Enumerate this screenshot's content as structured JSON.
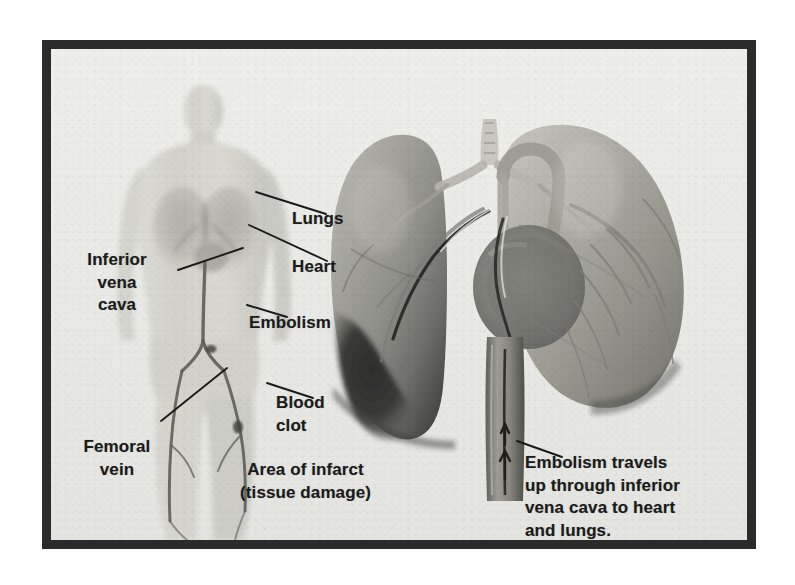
{
  "figure": {
    "kind": "medical-illustration",
    "frame_color": "#2b2b2b",
    "paper_color": "#e9e9e6",
    "ink_color": "#1b1b1b"
  },
  "labels": [
    {
      "id": "lungs",
      "text": "Lungs",
      "x": 283,
      "y": 199,
      "align": "left"
    },
    {
      "id": "heart",
      "text": "Heart",
      "x": 283,
      "y": 247,
      "align": "left"
    },
    {
      "id": "inferior-vena-cava",
      "text": "Inferior\nvena\ncava",
      "x": 62,
      "y": 240,
      "align": "center"
    },
    {
      "id": "embolism",
      "text": "Embolism",
      "x": 240,
      "y": 303,
      "align": "left"
    },
    {
      "id": "blood-clot",
      "text": "Blood\nclot",
      "x": 267,
      "y": 383,
      "align": "left"
    },
    {
      "id": "femoral-vein",
      "text": "Femoral\nvein",
      "x": 62,
      "y": 427,
      "align": "center"
    },
    {
      "id": "area-of-infarct",
      "text": "Area of infarct\n(tissue damage)",
      "x": 272,
      "y": 450,
      "align": "center"
    },
    {
      "id": "embolism-travels",
      "text": "Embolism travels\nup through inferior\nvena cava to heart\nand lungs.",
      "x": 516,
      "y": 443,
      "align": "left"
    }
  ],
  "anatomy": {
    "body_figure": {
      "name": "anterior full-body silhouette",
      "shows": [
        "torso",
        "lungs",
        "inferior vena cava",
        "femoral vein",
        "embolism",
        "blood clot"
      ]
    },
    "lung_figure": {
      "name": "anterior view of lungs, heart and great vessels",
      "shows": [
        "left lung",
        "right lung",
        "trachea",
        "bronchi",
        "aortic arch",
        "heart",
        "pulmonary arteries",
        "inferior vena cava",
        "area of infarct"
      ]
    },
    "infarct_color": "#3a3a3a",
    "lung_color": "#9a9a94",
    "vessel_color": "#5a5a58"
  },
  "leaders": {
    "lungs": {
      "from": [
        275,
        205
      ],
      "to": [
        205,
        182
      ]
    },
    "heart": {
      "from": [
        276,
        252
      ],
      "to": [
        198,
        216
      ]
    },
    "ivc": {
      "from": [
        127,
        261
      ],
      "to": [
        192,
        239
      ]
    },
    "embolism": {
      "from": [
        236,
        308
      ],
      "to": [
        196,
        296
      ]
    },
    "blood_clot": {
      "from": [
        262,
        389
      ],
      "to": [
        216,
        374
      ]
    },
    "femoral": {
      "from": [
        110,
        412
      ],
      "to": [
        176,
        359
      ]
    },
    "embolism_travels": {
      "from": [
        511,
        448
      ],
      "to": [
        468,
        432
      ]
    }
  }
}
